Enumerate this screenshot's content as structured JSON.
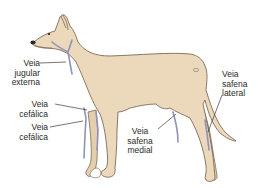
{
  "diagram": {
    "colors": {
      "body": "#ecd9bc",
      "outline": "#6e5a48",
      "vein": "#8f93b8",
      "leader_line": "#3a3a3a",
      "text": "#2a2a2a"
    },
    "labels": [
      {
        "id": "jugular",
        "lines": [
          "Veia",
          "jugular",
          "externa"
        ]
      },
      {
        "id": "cefalica_upper",
        "lines": [
          "Veia",
          "cefálica"
        ]
      },
      {
        "id": "cefalica_lower",
        "lines": [
          "Veia",
          "cefálica"
        ]
      },
      {
        "id": "safena_medial",
        "lines": [
          "Veia",
          "safena",
          "medial"
        ]
      },
      {
        "id": "safena_lateral",
        "lines": [
          "Veia",
          "safena",
          "lateral"
        ]
      }
    ]
  }
}
